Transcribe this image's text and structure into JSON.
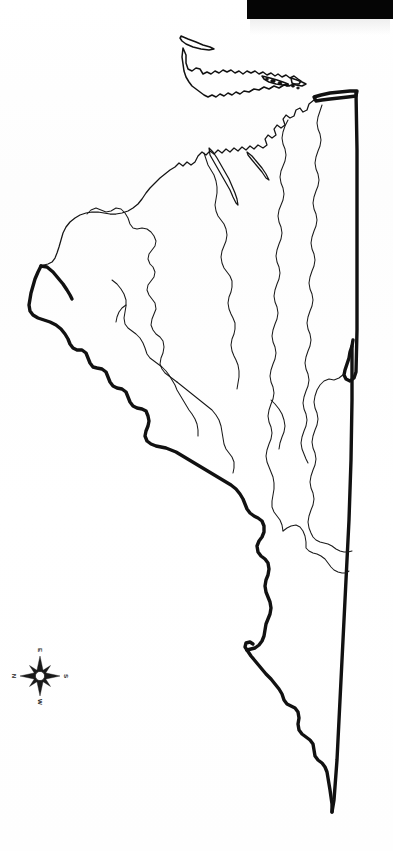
{
  "document": {
    "type": "outline-map",
    "title": "Outline map",
    "background_color": "#fefefe",
    "ink_color": "#111111",
    "scan_artifact": {
      "name": "black-scan-bar",
      "color": "#050505",
      "x": 247,
      "y": 0,
      "width": 146,
      "height": 19
    }
  },
  "map": {
    "has_outer_boundary": true,
    "has_internal_divisions": true,
    "outer_boundary_style": "thick-black-line",
    "internal_division_style": "thin-black-line",
    "island_chain_present": true,
    "island_chain_position": "top",
    "fill": "none",
    "label_text": ""
  },
  "compass": {
    "name": "compass-rose",
    "rotation_degrees": 90,
    "points": [
      {
        "key": "N",
        "label": "N",
        "position": "left"
      },
      {
        "key": "E",
        "label": "E",
        "position": "top"
      },
      {
        "key": "S",
        "label": "S",
        "position": "right"
      },
      {
        "key": "W",
        "label": "W",
        "position": "bottom"
      }
    ],
    "center_x": 40,
    "center_y": 676
  }
}
